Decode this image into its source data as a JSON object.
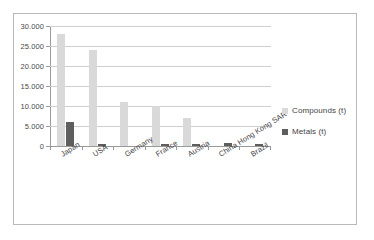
{
  "chart_data": {
    "type": "bar",
    "title": "",
    "xlabel": "",
    "ylabel": "",
    "categories": [
      "Japan",
      "USA",
      "Germany",
      "France",
      "Austria",
      "China Hong Kong SAR",
      "Brazil"
    ],
    "series": [
      {
        "name": "Compounds (t)",
        "color": "#d9d9d9",
        "values": [
          27900,
          23900,
          11000,
          10100,
          6900,
          0,
          0
        ]
      },
      {
        "name": "Metals (t)",
        "color": "#5e5e5e",
        "values": [
          6100,
          400,
          0,
          400,
          400,
          700,
          400
        ]
      }
    ],
    "ylim": [
      0,
      30000
    ],
    "ytick_values": [
      0,
      5000,
      10000,
      15000,
      20000,
      25000,
      30000
    ],
    "ytick_labels": [
      "0",
      "5.000",
      "10.000",
      "15.000",
      "20.000",
      "25.000",
      "30.000"
    ],
    "grid": true,
    "legend_position": "right",
    "legend_entries": [
      "Compounds (t)",
      "Metals (t)"
    ]
  },
  "colors": {
    "compounds": "#d9d9d9",
    "metals": "#5e5e5e",
    "gridline": "#cfcfcf",
    "axis": "#9a9a9a",
    "border": "#b9b9b9",
    "text": "#3f3f3f",
    "background": "#ffffff"
  }
}
